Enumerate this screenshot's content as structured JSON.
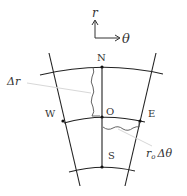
{
  "diagram": {
    "type": "polar-grid-control-volume",
    "axes": {
      "r_label": "r",
      "theta_label": "θ"
    },
    "nodes": {
      "north": "N",
      "origin": "O",
      "west": "W",
      "east": "E",
      "south": "S"
    },
    "annotations": {
      "delta_r": "Δr",
      "arc_r": "r",
      "arc_sub": "o",
      "arc_delta_theta": "Δθ"
    },
    "colors": {
      "line": "#222222",
      "leader": "#d8d8d8",
      "text": "#333333",
      "background": "#ffffff"
    }
  }
}
